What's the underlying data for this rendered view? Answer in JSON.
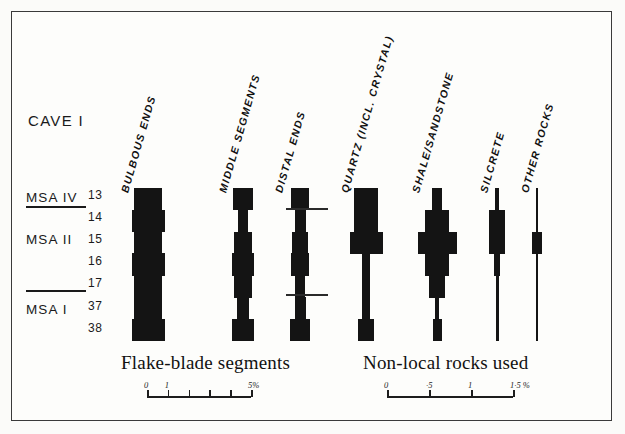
{
  "figure": {
    "site_title": "CAVE I",
    "left_caption": "Flake-blade  segments",
    "right_caption": "Non-local rocks used"
  },
  "industries": [
    {
      "name": "MSA IV"
    },
    {
      "name": "MSA II"
    },
    {
      "name": "MSA I"
    }
  ],
  "layers": [
    "13",
    "14",
    "15",
    "16",
    "17",
    "37",
    "38"
  ],
  "columns": {
    "left": [
      {
        "label": "BULBOUS ENDS"
      },
      {
        "label": "MIDDLE SEGMENTS"
      },
      {
        "label": "DISTAL ENDS"
      }
    ],
    "right": [
      {
        "label": "QUARTZ (INCL. CRYSTAL)"
      },
      {
        "label": "SHALE/SANDSTONE"
      },
      {
        "label": "SILCRETE"
      },
      {
        "label": "OTHER ROCKS"
      }
    ]
  },
  "scales": {
    "left": {
      "unit": "%",
      "labels": [
        {
          "text": "0",
          "value": 0
        },
        {
          "text": "1",
          "value": 1
        },
        {
          "text": "5%",
          "value": 5
        }
      ],
      "ticks": [
        0,
        1,
        2,
        3,
        4,
        5
      ],
      "max": 5
    },
    "right": {
      "unit": "%",
      "labels": [
        {
          "text": "0",
          "value": 0
        },
        {
          "text": "·5",
          "value": 0.5
        },
        {
          "text": "1",
          "value": 1
        },
        {
          "text": "1·5 %",
          "value": 1.5
        }
      ],
      "ticks": [
        0,
        0.5,
        1,
        1.5
      ],
      "max": 1.5
    }
  },
  "colors": {
    "bar": "#141414",
    "ink": "#1a1a1a",
    "frame": "#3a3a3a",
    "paper": "#fdfdfb"
  },
  "chart_data": {
    "type": "bar",
    "title": "CAVE I",
    "orientation": "horizontal-mirrored-stacked-by-layer",
    "xlabel": "",
    "ylabel": "Layer",
    "categories": [
      "13",
      "14",
      "15",
      "16",
      "17",
      "37",
      "38"
    ],
    "panels": [
      {
        "name": "Flake-blade segments",
        "xlim": [
          0,
          5
        ],
        "xlabel": "%",
        "series": [
          {
            "name": "BULBOUS ENDS",
            "values": [
              4.2,
              5.0,
              4.2,
              5.0,
              4.2,
              4.2,
              5.0
            ]
          },
          {
            "name": "MIDDLE SEGMENTS",
            "values": [
              2.0,
              1.0,
              1.9,
              2.2,
              1.9,
              1.3,
              2.2
            ]
          },
          {
            "name": "DISTAL ENDS",
            "values": [
              1.7,
              1.0,
              1.4,
              1.7,
              0.9,
              1.0,
              1.8
            ]
          }
        ]
      },
      {
        "name": "Non-local rocks used",
        "xlim": [
          0,
          1.5
        ],
        "xlabel": "%",
        "series": [
          {
            "name": "QUARTZ (INCL. CRYSTAL)",
            "values": [
              0.8,
              0.8,
              1.1,
              0.28,
              0.28,
              0.28,
              0.52
            ]
          },
          {
            "name": "SHALE/SANDSTONE",
            "values": [
              0.34,
              0.8,
              1.3,
              0.8,
              0.52,
              0.12,
              0.3
            ]
          },
          {
            "name": "SILCRETE",
            "values": [
              0.12,
              0.52,
              0.52,
              0.2,
              0.1,
              0.1,
              0.1
            ]
          },
          {
            "name": "OTHER ROCKS",
            "values": [
              0.05,
              0.05,
              0.34,
              0.05,
              0.08,
              0.08,
              0.05
            ]
          }
        ]
      }
    ],
    "grid": false,
    "legend": "none"
  }
}
